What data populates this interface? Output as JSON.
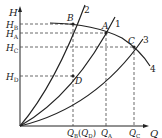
{
  "axes": {
    "y_label": "H",
    "x_label": "Q"
  },
  "y_ticks": [
    {
      "main": "H",
      "sub": "B",
      "y": 24
    },
    {
      "main": "H",
      "sub": "A",
      "y": 33
    },
    {
      "main": "H",
      "sub": "C",
      "y": 47
    },
    {
      "main": "H",
      "sub": "D",
      "y": 76
    }
  ],
  "x_ticks": {
    "qb": {
      "main": "Q",
      "sub": "B"
    },
    "qd": {
      "main": "Q",
      "sub": "D"
    },
    "qa": {
      "main": "Q",
      "sub": "A"
    },
    "qc": {
      "main": "Q",
      "sub": "C"
    }
  },
  "points": {
    "A": "A",
    "B": "B",
    "C": "C",
    "D": "D"
  },
  "curve_labels": {
    "c1": "1",
    "c2": "2",
    "c3": "3",
    "c4": "4"
  },
  "colors": {
    "line": "#222222",
    "dash": "#444444"
  }
}
